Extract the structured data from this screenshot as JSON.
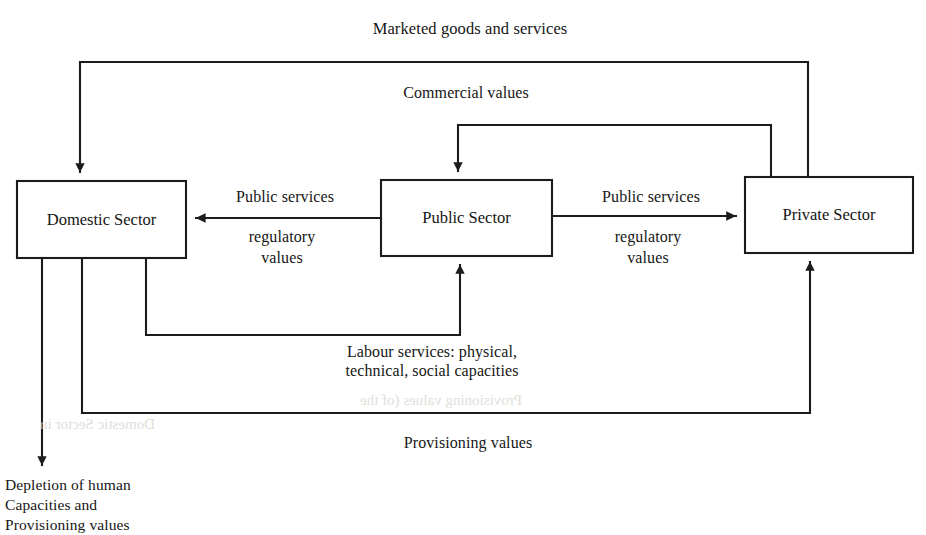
{
  "diagram": {
    "title_top": "Marketed goods and services",
    "nodes": [
      {
        "id": "domestic",
        "label": "Domestic Sector",
        "x": 17,
        "y": 181,
        "w": 169,
        "h": 77
      },
      {
        "id": "public",
        "label": "Public Sector",
        "x": 381,
        "y": 180,
        "w": 171,
        "h": 76
      },
      {
        "id": "private",
        "label": "Private Sector",
        "x": 745,
        "y": 177,
        "w": 168,
        "h": 76
      }
    ],
    "edge_labels": {
      "marketed_goods": "Marketed goods and services",
      "commercial_values": "Commercial values",
      "public_services_left": "Public services",
      "regulatory_values_left_line1": "regulatory",
      "regulatory_values_left_line2": "values",
      "public_services_right": "Public services",
      "regulatory_values_right_line1": "regulatory",
      "regulatory_values_right_line2": "values",
      "labour_services_line1": "Labour services: physical,",
      "labour_services_line2": "technical, social capacities",
      "provisioning_values": "Provisioning values"
    },
    "outcome_label": {
      "line1": "Depletion of human",
      "line2": "Capacities and",
      "line3": "Provisioning values"
    },
    "colors": {
      "stroke": "#1c1c1c",
      "background": "#ffffff",
      "text": "#161616",
      "ghost": "#d8d4ce"
    },
    "ghost_text": {
      "line1": "Provisioning values (of the",
      "line2": "Domestic Sector in"
    }
  }
}
